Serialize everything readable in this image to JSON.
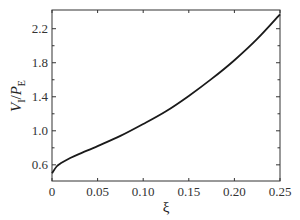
{
  "chart_data": {
    "type": "line",
    "title": "",
    "xlabel": "ξ",
    "ylabel": "V_I/P_E",
    "ylabel_parts": {
      "v": "V",
      "v_sub": "I",
      "slash": "/",
      "p": "P",
      "p_sub": "E"
    },
    "xlim": [
      0,
      0.25
    ],
    "ylim": [
      0.41,
      2.42
    ],
    "xticks": [
      0,
      0.05,
      0.1,
      0.15,
      0.2,
      0.25
    ],
    "xtick_labels": [
      "0",
      "0.05",
      "0.10",
      "0.15",
      "0.20",
      "0.25"
    ],
    "yticks": [
      0.6,
      1.0,
      1.4,
      1.8,
      2.2
    ],
    "ytick_labels": [
      "0.6",
      "1.0",
      "1.4",
      "1.8",
      "2.2"
    ],
    "grid": false,
    "legend": null,
    "series": [
      {
        "name": "V_I/P_E",
        "color": "#1a1a1a",
        "x": [
          0,
          0.005,
          0.01,
          0.02,
          0.03,
          0.05,
          0.075,
          0.1,
          0.125,
          0.15,
          0.175,
          0.2,
          0.225,
          0.25
        ],
        "y": [
          0.5,
          0.58,
          0.62,
          0.68,
          0.73,
          0.82,
          0.94,
          1.08,
          1.23,
          1.41,
          1.61,
          1.83,
          2.08,
          2.37
        ]
      }
    ]
  }
}
